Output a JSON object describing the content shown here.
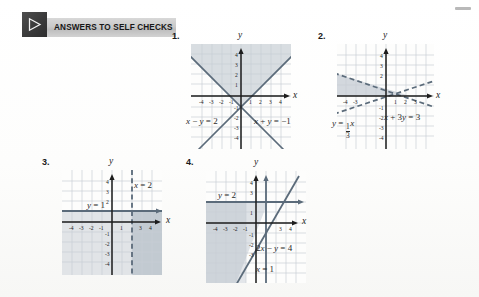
{
  "banner": {
    "label": "ANSWERS TO SELF CHECKS",
    "icon": "play-triangle-icon"
  },
  "colors": {
    "grid": "#c8cfd6",
    "axis": "#1d1d1d",
    "line": "#5b6b7a",
    "shade": "#b9c2cb",
    "banner_bg": "#cacaca",
    "page_bg": "#fbfbfa"
  },
  "figures": [
    {
      "number": "1.",
      "axis_x_label": "x",
      "axis_y_label": "y",
      "x_ticks": [
        "-4",
        "-3",
        "-2",
        "-1",
        "1",
        "2",
        "3",
        "4"
      ],
      "y_ticks": [
        "4",
        "3",
        "2",
        "1",
        "-1",
        "-2",
        "-3",
        "-4"
      ],
      "equations": [
        {
          "id": "eq-left",
          "parts": [
            "x",
            " − ",
            "y",
            " = ",
            "2"
          ]
        },
        {
          "id": "eq-right",
          "parts": [
            "x",
            " + ",
            "y",
            " = ",
            "−1"
          ]
        }
      ],
      "lines": [
        {
          "name": "x-minus-y-equals-2",
          "style": "solid"
        },
        {
          "name": "x-plus-y-equals-negative-1",
          "style": "solid"
        }
      ],
      "shaded_region": "upper-wedge-between-lines"
    },
    {
      "number": "2.",
      "axis_x_label": "x",
      "axis_y_label": "y",
      "x_ticks": [
        "-4",
        "-3",
        "1",
        "2",
        "3"
      ],
      "y_ticks": [
        "4",
        "3",
        "2",
        "-1",
        "-2",
        "-3",
        "-4"
      ],
      "equations": [
        {
          "id": "eq-frac",
          "lhs": "y",
          "op": "=",
          "numerator": "1",
          "denominator": "3",
          "var": "x"
        },
        {
          "id": "eq-right",
          "parts": [
            "x",
            " + ",
            "3",
            "y",
            " = ",
            "3"
          ]
        }
      ],
      "lines": [
        {
          "name": "y-equals-one-third-x",
          "style": "dashed"
        },
        {
          "name": "x-plus-3y-equals-3",
          "style": "dashed"
        }
      ],
      "shaded_region": "upper-left-wedge-between-dashed-lines"
    },
    {
      "number": "3.",
      "axis_x_label": "x",
      "axis_y_label": "y",
      "x_ticks": [
        "-4",
        "-3",
        "-2",
        "-1",
        "1",
        "3",
        "4"
      ],
      "y_ticks": [
        "4",
        "3",
        "2",
        "-1",
        "-2",
        "-3",
        "-4"
      ],
      "equations": [
        {
          "id": "eq-y",
          "parts": [
            "y",
            " = ",
            "1"
          ]
        },
        {
          "id": "eq-x",
          "parts": [
            "x",
            " = ",
            "2"
          ]
        }
      ],
      "lines": [
        {
          "name": "y-equals-1",
          "style": "solid"
        },
        {
          "name": "x-equals-2",
          "style": "dashed"
        }
      ],
      "shaded_region": "right-of-x-equals-2-below-y-equals-1"
    },
    {
      "number": "4.",
      "axis_x_label": "x",
      "axis_y_label": "y",
      "x_ticks": [
        "-4",
        "-3",
        "-2",
        "-1",
        "3",
        "4"
      ],
      "y_ticks": [
        "4",
        "3",
        "1",
        "-1",
        "-2",
        "-3"
      ],
      "equations": [
        {
          "id": "eq-y",
          "parts": [
            "y",
            " = ",
            "2"
          ]
        },
        {
          "id": "eq-slant",
          "parts": [
            "2",
            "x",
            " − ",
            "y",
            " = ",
            "4"
          ]
        },
        {
          "id": "eq-x",
          "parts": [
            "x",
            " = ",
            "1"
          ]
        }
      ],
      "lines": [
        {
          "name": "y-equals-2",
          "style": "solid"
        },
        {
          "name": "x-equals-1",
          "style": "solid"
        },
        {
          "name": "2x-minus-y-equals-4",
          "style": "solid"
        }
      ],
      "shaded_region": "left-of-slant-line-below-y-equals-2"
    }
  ]
}
